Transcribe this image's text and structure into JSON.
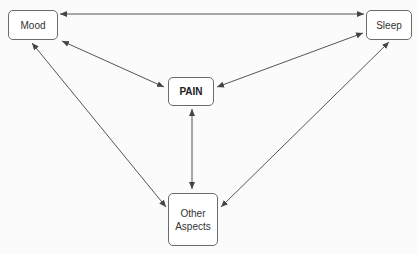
{
  "diagram": {
    "nodes": {
      "mood": {
        "label": "Mood"
      },
      "sleep": {
        "label": "Sleep"
      },
      "pain": {
        "label": "PAIN"
      },
      "other": {
        "label_line1": "Other",
        "label_line2": "Aspects"
      }
    },
    "edges": [
      {
        "from": "mood",
        "to": "sleep",
        "type": "bidirectional"
      },
      {
        "from": "mood",
        "to": "pain",
        "type": "bidirectional"
      },
      {
        "from": "sleep",
        "to": "pain",
        "type": "bidirectional"
      },
      {
        "from": "pain",
        "to": "other",
        "type": "bidirectional"
      },
      {
        "from": "mood",
        "to": "other",
        "type": "bidirectional"
      },
      {
        "from": "sleep",
        "to": "other",
        "type": "bidirectional"
      }
    ],
    "colors": {
      "line": "#555555",
      "border": "#6b6b6b",
      "background": "#fbfbfb"
    }
  }
}
